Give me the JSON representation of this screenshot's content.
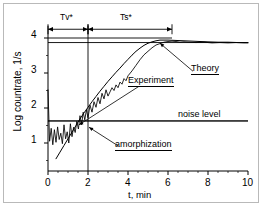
{
  "chart_data": {
    "type": "line",
    "title": "",
    "xlabel": "t, min",
    "ylabel": "Log countrate, 1/s",
    "xlim": [
      0,
      10
    ],
    "ylim": [
      0.2,
      4.35
    ],
    "xticks": [
      0,
      2,
      4,
      6,
      8,
      10
    ],
    "yticks": [
      1,
      2,
      3,
      4
    ],
    "xtick_labels": [
      "0",
      "2",
      "4",
      "6",
      "8",
      "10"
    ],
    "ytick_labels": [
      "1",
      "2",
      "3",
      "4"
    ],
    "x_minor_step": 0.5,
    "y_minor_step": 0.5,
    "grid": false,
    "legend_position": "inline-annotations",
    "series": [
      {
        "name": "Experiment",
        "style": "noisy-line",
        "color": "#000000",
        "x": [
          0.0,
          0.08,
          0.16,
          0.24,
          0.32,
          0.4,
          0.48,
          0.56,
          0.64,
          0.72,
          0.8,
          0.88,
          0.96,
          1.04,
          1.12,
          1.2,
          1.28,
          1.36,
          1.44,
          1.52,
          1.6,
          1.68,
          1.76,
          1.84,
          1.92,
          2.0,
          2.1,
          2.2,
          2.3,
          2.4,
          2.5,
          2.6,
          2.7,
          2.8,
          2.9,
          3.0,
          3.1,
          3.2,
          3.3,
          3.4,
          3.5,
          3.6,
          3.7,
          3.8,
          3.9,
          4.0,
          4.2,
          4.4,
          4.6,
          4.8,
          5.0,
          5.2,
          5.4,
          5.6,
          5.8,
          6.0,
          6.2,
          6.4,
          6.6,
          6.8,
          7.0,
          7.4,
          7.8,
          8.2,
          8.6,
          9.0,
          9.4,
          9.8,
          10.0
        ],
        "y": [
          2.52,
          1.05,
          1.42,
          0.95,
          1.38,
          1.02,
          1.46,
          1.1,
          1.28,
          0.98,
          1.52,
          1.12,
          1.32,
          1.0,
          1.55,
          1.18,
          1.45,
          1.3,
          1.62,
          1.4,
          1.78,
          1.52,
          1.88,
          1.66,
          1.95,
          1.72,
          2.08,
          1.88,
          2.18,
          2.02,
          2.3,
          2.12,
          2.42,
          2.26,
          2.52,
          2.34,
          2.46,
          2.58,
          2.5,
          2.66,
          2.58,
          2.74,
          2.68,
          2.84,
          2.78,
          2.92,
          3.06,
          3.22,
          3.38,
          3.52,
          3.62,
          3.72,
          3.8,
          3.84,
          3.88,
          3.9,
          3.91,
          3.9,
          3.88,
          3.89,
          3.88,
          3.87,
          3.88,
          3.86,
          3.87,
          3.86,
          3.87,
          3.86,
          3.86
        ]
      },
      {
        "name": "Theory",
        "style": "smooth-line",
        "color": "#000000",
        "x": [
          0.4,
          0.6,
          0.8,
          1.0,
          1.2,
          1.4,
          1.6,
          1.8,
          2.0,
          2.2,
          2.4,
          2.6,
          2.8,
          3.0,
          3.2,
          3.4,
          3.6,
          3.8,
          4.0,
          4.2,
          4.4,
          4.6,
          4.8,
          5.0,
          5.2,
          5.4,
          5.6,
          5.8,
          6.0,
          6.4,
          6.8,
          7.2,
          7.6,
          8.0,
          8.5,
          9.0,
          9.5,
          10.0
        ],
        "y": [
          0.55,
          0.74,
          0.93,
          1.12,
          1.31,
          1.5,
          1.69,
          1.86,
          2.02,
          2.18,
          2.33,
          2.48,
          2.62,
          2.76,
          2.89,
          3.02,
          3.14,
          3.27,
          3.39,
          3.51,
          3.62,
          3.71,
          3.79,
          3.85,
          3.89,
          3.92,
          3.94,
          3.94,
          3.94,
          3.93,
          3.92,
          3.91,
          3.9,
          3.89,
          3.88,
          3.88,
          3.87,
          3.87
        ]
      }
    ],
    "reference_lines": [
      {
        "name": "noise-level-line",
        "orientation": "horizontal",
        "value": 1.63,
        "x_from": 0.0,
        "x_to": 10.0
      },
      {
        "name": "plateau-line",
        "orientation": "horizontal",
        "value": 3.87,
        "x_from": 0.0,
        "x_to": 10.0
      },
      {
        "name": "top-level-line",
        "orientation": "horizontal",
        "value": 4.0,
        "x_from": 0.0,
        "x_to": 6.2
      },
      {
        "name": "tv-ts-boundary-line",
        "orientation": "vertical",
        "value": 2.0,
        "y_from": 0.2,
        "y_to": 4.35
      }
    ],
    "span_markers": [
      {
        "label": "Tv*",
        "from": 0.0,
        "to": 2.0,
        "y": 4.25
      },
      {
        "label": "Ts*",
        "from": 2.0,
        "to": 6.2,
        "y": 4.25
      }
    ],
    "annotations": [
      {
        "name": "theory-label",
        "text": "Theory",
        "x": 7.25,
        "y": 3.05,
        "underline": true,
        "leader_to": {
          "x": 5.6,
          "y": 3.85
        }
      },
      {
        "name": "experiment-label",
        "text": "Experiment",
        "x": 4.55,
        "y": 2.62,
        "underline": true,
        "leader_to": {
          "x": 1.55,
          "y": 1.52
        }
      },
      {
        "name": "noise-level-label",
        "text": "noise level",
        "x": 6.6,
        "y": 1.82,
        "underline": false
      },
      {
        "name": "amorphization-label",
        "text": "amorphization",
        "x": 3.5,
        "y": 0.92,
        "underline": true,
        "leader_to": {
          "x": 2.05,
          "y": 1.45
        }
      }
    ]
  },
  "axis": {
    "x_title": "t, min",
    "y_title": "Log countrate, 1/s",
    "x_tick_labels": [
      "0",
      "2",
      "4",
      "6",
      "8",
      "10"
    ],
    "y_tick_labels": [
      "1",
      "2",
      "3",
      "4"
    ]
  },
  "labels": {
    "tv_span": "Tv*",
    "ts_span": "Ts*",
    "theory": "Theory",
    "experiment": "Experiment",
    "noise_level": "noise level",
    "amorphization": "amorphization"
  },
  "colors": {
    "ink": "#000000",
    "frame": "#b9b9b9",
    "background": "#ffffff"
  }
}
